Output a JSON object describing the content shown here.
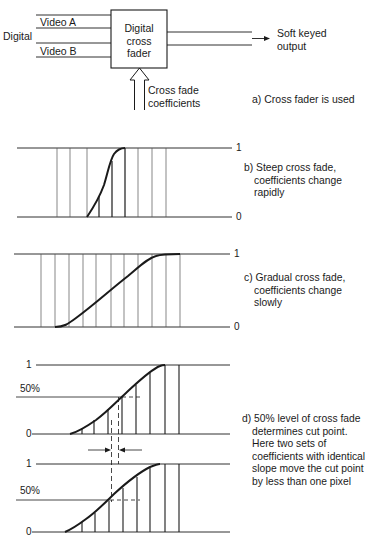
{
  "block_diagram": {
    "input_group_label": "Digital",
    "input_a": "Video A",
    "input_b": "Video B",
    "box_label": [
      "Digital",
      "cross",
      "fader"
    ],
    "output_label": [
      "Soft keyed",
      "output"
    ],
    "control_label": [
      "Cross fade",
      "coefficients"
    ],
    "caption": "a) Cross fader is used"
  },
  "panel_b": {
    "label_top": "1",
    "label_bottom": "0",
    "caption": [
      "b) Steep cross fade,",
      "coefficients change",
      "rapidly"
    ]
  },
  "panel_c": {
    "label_top": "1",
    "label_bottom": "0",
    "caption": [
      "c) Gradual cross fade,",
      "coefficients change",
      "slowly"
    ]
  },
  "panel_d": {
    "upper": {
      "label_top": "1",
      "label_mid": "50%",
      "label_bottom": "0"
    },
    "lower": {
      "label_top": "1",
      "label_mid": "50%",
      "label_bottom": "0"
    },
    "caption": [
      "d) 50% level of cross fade",
      "determines cut point.",
      "Here two sets of",
      "coefficients with identical",
      "slope move the cut point",
      "by less than one pixel"
    ]
  },
  "colors": {
    "ink": "#1a1a1a",
    "thin": "#555555",
    "background": "#ffffff"
  }
}
